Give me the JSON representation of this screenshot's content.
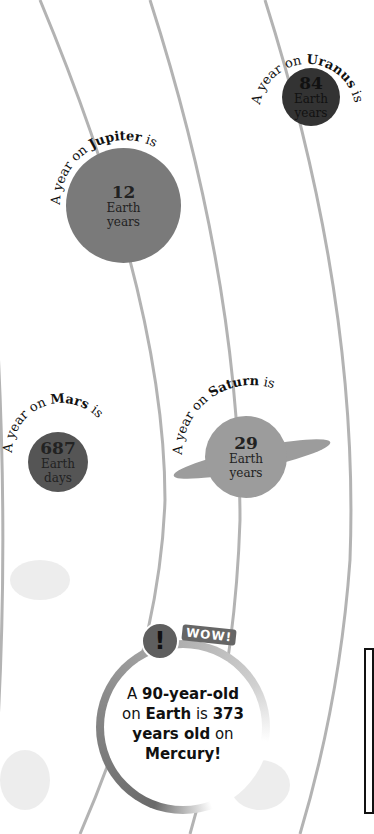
{
  "planets": [
    {
      "name": "Uranus",
      "prefix": "A year on ",
      "suffix": " is",
      "value": "84",
      "unit": "Earth years",
      "color": "#333333"
    },
    {
      "name": "Jupiter",
      "prefix": "A year on ",
      "suffix": " is",
      "value": "12",
      "unit": "Earth years",
      "color": "#7a7a7a"
    },
    {
      "name": "Mars",
      "prefix": "A year on ",
      "suffix": " is",
      "value": "687",
      "unit": "Earth days",
      "color": "#555555"
    },
    {
      "name": "Saturn",
      "prefix": "A year on ",
      "suffix": " is",
      "value": "29",
      "unit": "Earth years",
      "color": "#9c9c9c"
    }
  ],
  "callout": {
    "badge": "!",
    "label": "WOW!",
    "line1_a": "A ",
    "line1_b": "90-year-old",
    "line2_a": "on ",
    "line2_b": "Earth",
    "line2_c": " is ",
    "line2_d": "373",
    "line3_a": "years old",
    "line3_b": " on",
    "line4": "Mercury!"
  },
  "colors": {
    "orbit": "#b3b3b3",
    "ring_dark": "#6a6a6a"
  }
}
